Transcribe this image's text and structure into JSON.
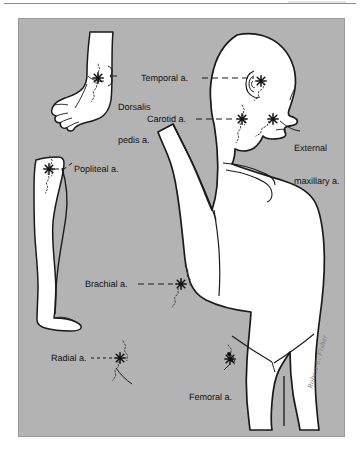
{
  "figure": {
    "background_color": "#b3b3b3",
    "skin_color": "#ffffff",
    "outline_color": "#1a1a1a",
    "label_color": "#141414",
    "signature": "Robert E. Fisher"
  },
  "labels": {
    "dorsalis_pedis_line1": "Dorsalis",
    "dorsalis_pedis_line2": "pedis a.",
    "temporal": "Temporal a.",
    "carotid": "Carotid a.",
    "external_maxillary_line1": "External",
    "external_maxillary_line2": "maxillary a.",
    "popliteal": "Popliteal a.",
    "brachial": "Brachial a.",
    "radial": "Radial a.",
    "femoral": "Femoral a."
  },
  "pressure_points": [
    {
      "id": "dorsalis-pedis",
      "name": "Dorsalis pedis a.",
      "region": "foot-inset",
      "marker": "star"
    },
    {
      "id": "temporal",
      "name": "Temporal a.",
      "region": "head-temple",
      "marker": "star"
    },
    {
      "id": "carotid",
      "name": "Carotid a.",
      "region": "neck",
      "marker": "star"
    },
    {
      "id": "external-maxillary",
      "name": "External maxillary a.",
      "region": "jaw",
      "marker": "star"
    },
    {
      "id": "popliteal",
      "name": "Popliteal a.",
      "region": "leg-inset-knee",
      "marker": "star"
    },
    {
      "id": "brachial",
      "name": "Brachial a.",
      "region": "upper-arm",
      "marker": "star"
    },
    {
      "id": "radial",
      "name": "Radial a.",
      "region": "wrist",
      "marker": "star"
    },
    {
      "id": "femoral",
      "name": "Femoral a.",
      "region": "groin",
      "marker": "star"
    }
  ]
}
